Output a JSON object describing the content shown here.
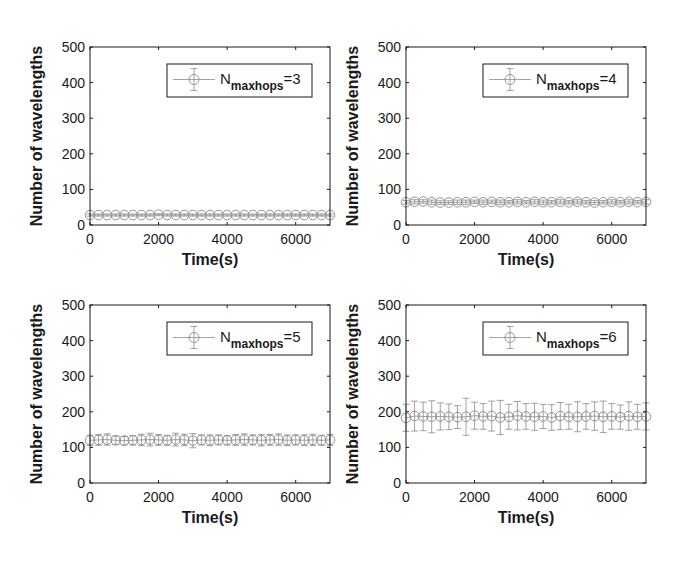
{
  "figure": {
    "layout": "2x2 subplots",
    "colors": {
      "axis": "#1a1a1a",
      "series": "#8a8a8a",
      "background": "#ffffff"
    }
  },
  "chart_data": [
    {
      "type": "line",
      "subtype": "errorbar",
      "title": "",
      "xlabel": "Time(s)",
      "ylabel": "Number of wavelengths",
      "xlim": [
        0,
        7000
      ],
      "ylim": [
        0,
        500
      ],
      "xticks": [
        "0",
        "2000",
        "4000",
        "6000"
      ],
      "yticks": [
        "0",
        "100",
        "200",
        "300",
        "400",
        "500"
      ],
      "grid": false,
      "legend_position": "upper right",
      "series": [
        {
          "name": "N_maxhops=3",
          "legend_main": "N",
          "legend_sub": "maxhops",
          "legend_suffix": "=3",
          "x": [
            0,
            250,
            500,
            750,
            1000,
            1250,
            1500,
            1750,
            2000,
            2250,
            2500,
            2750,
            3000,
            3250,
            3500,
            3750,
            4000,
            4250,
            4500,
            4750,
            5000,
            5250,
            5500,
            5750,
            6000,
            6250,
            6500,
            6750,
            7000
          ],
          "y": [
            28,
            28,
            28,
            28,
            28,
            28,
            28,
            28,
            29,
            28,
            28,
            28,
            28,
            28,
            28,
            28,
            28,
            28,
            28,
            28,
            28,
            28,
            28,
            28,
            28,
            28,
            28,
            28,
            28
          ],
          "err": [
            3,
            3,
            3,
            3,
            3,
            3,
            3,
            3,
            3,
            3,
            3,
            3,
            3,
            3,
            3,
            3,
            3,
            3,
            3,
            3,
            3,
            3,
            3,
            3,
            3,
            3,
            3,
            3,
            3
          ]
        }
      ]
    },
    {
      "type": "line",
      "subtype": "errorbar",
      "title": "",
      "xlabel": "Time(s)",
      "ylabel": "Number of wavelengths",
      "xlim": [
        0,
        7000
      ],
      "ylim": [
        0,
        500
      ],
      "xticks": [
        "0",
        "2000",
        "4000",
        "6000"
      ],
      "yticks": [
        "0",
        "100",
        "200",
        "300",
        "400",
        "500"
      ],
      "grid": false,
      "legend_position": "upper right",
      "series": [
        {
          "name": "N_maxhops=4",
          "legend_main": "N",
          "legend_sub": "maxhops",
          "legend_suffix": "=4",
          "x": [
            0,
            250,
            500,
            750,
            1000,
            1250,
            1500,
            1750,
            2000,
            2250,
            2500,
            2750,
            3000,
            3250,
            3500,
            3750,
            4000,
            4250,
            4500,
            4750,
            5000,
            5250,
            5500,
            5750,
            6000,
            6250,
            6500,
            6750,
            7000
          ],
          "y": [
            64,
            65,
            66,
            64,
            63,
            63,
            64,
            64,
            65,
            64,
            65,
            64,
            64,
            65,
            64,
            65,
            64,
            64,
            65,
            64,
            65,
            64,
            63,
            64,
            65,
            64,
            65,
            64,
            65
          ],
          "err": [
            5,
            6,
            5,
            6,
            5,
            5,
            6,
            6,
            5,
            6,
            5,
            6,
            5,
            6,
            5,
            6,
            6,
            5,
            6,
            5,
            6,
            5,
            6,
            5,
            6,
            5,
            6,
            5,
            6
          ]
        }
      ]
    },
    {
      "type": "line",
      "subtype": "errorbar",
      "title": "",
      "xlabel": "Time(s)",
      "ylabel": "Number of wavelengths",
      "xlim": [
        0,
        7000
      ],
      "ylim": [
        0,
        500
      ],
      "xticks": [
        "0",
        "2000",
        "4000",
        "6000"
      ],
      "yticks": [
        "0",
        "100",
        "200",
        "300",
        "400",
        "500"
      ],
      "grid": false,
      "legend_position": "upper right",
      "series": [
        {
          "name": "N_maxhops=5",
          "legend_main": "N",
          "legend_sub": "maxhops",
          "legend_suffix": "=5",
          "x": [
            0,
            250,
            500,
            750,
            1000,
            1250,
            1500,
            1750,
            2000,
            2250,
            2500,
            2750,
            3000,
            3250,
            3500,
            3750,
            4000,
            4250,
            4500,
            4750,
            5000,
            5250,
            5500,
            5750,
            6000,
            6250,
            6500,
            6750,
            7000
          ],
          "y": [
            120,
            121,
            122,
            120,
            119,
            120,
            121,
            122,
            121,
            120,
            122,
            121,
            119,
            121,
            120,
            121,
            120,
            121,
            122,
            121,
            120,
            121,
            122,
            120,
            121,
            120,
            121,
            120,
            121
          ],
          "err": [
            14,
            15,
            16,
            12,
            12,
            13,
            16,
            18,
            15,
            14,
            18,
            16,
            20,
            14,
            15,
            14,
            13,
            15,
            16,
            14,
            16,
            15,
            16,
            15,
            14,
            15,
            16,
            14,
            15
          ]
        }
      ]
    },
    {
      "type": "line",
      "subtype": "errorbar",
      "title": "",
      "xlabel": "Time(s)",
      "ylabel": "Number of wavelengths",
      "xlim": [
        0,
        7000
      ],
      "ylim": [
        0,
        500
      ],
      "xticks": [
        "0",
        "2000",
        "4000",
        "6000"
      ],
      "yticks": [
        "0",
        "100",
        "200",
        "300",
        "400",
        "500"
      ],
      "grid": false,
      "legend_position": "upper right",
      "series": [
        {
          "name": "N_maxhops=6",
          "legend_main": "N",
          "legend_sub": "maxhops",
          "legend_suffix": "=6",
          "x": [
            0,
            250,
            500,
            750,
            1000,
            1250,
            1500,
            1750,
            2000,
            2250,
            2500,
            2750,
            3000,
            3250,
            3500,
            3750,
            4000,
            4250,
            4500,
            4750,
            5000,
            5250,
            5500,
            5750,
            6000,
            6250,
            6500,
            6750,
            7000
          ],
          "y": [
            183,
            188,
            187,
            186,
            187,
            186,
            185,
            186,
            189,
            187,
            188,
            184,
            186,
            189,
            187,
            186,
            187,
            184,
            188,
            186,
            186,
            187,
            188,
            186,
            187,
            185,
            188,
            186,
            187
          ],
          "err": [
            38,
            42,
            40,
            45,
            38,
            36,
            32,
            52,
            38,
            36,
            42,
            48,
            35,
            40,
            36,
            38,
            34,
            36,
            38,
            35,
            42,
            36,
            40,
            44,
            36,
            34,
            40,
            35,
            38
          ]
        }
      ]
    }
  ]
}
